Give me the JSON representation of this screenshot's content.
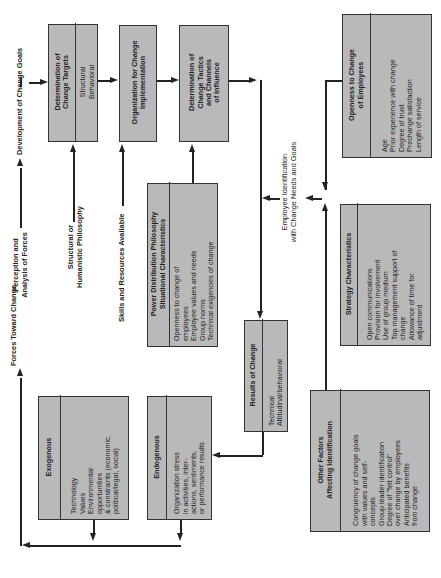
{
  "flow_labels": {
    "forces_toward_change": "Forces Toward Change",
    "perception_line1": "Perception and",
    "perception_line2": "Analysis of Forces",
    "development_goals": "Development of Change Goals",
    "philosophy_line1": "Structural or",
    "philosophy_line2": "Humanistic Philosophy",
    "skills_resources": "Skills and Resources Available",
    "identification_line1": "Employee Identification",
    "identification_line2": "with Change Needs and Goals"
  },
  "boxes": {
    "change_targets": {
      "title_line1": "Determination of",
      "title_line2": "Change Targets",
      "items": [
        "Structural",
        "Behavioral"
      ]
    },
    "organization": {
      "title_line1": "Organization for Change",
      "title_line2": "Implementation"
    },
    "tactics": {
      "title_line1": "Determination of",
      "title_line2": "Change Tactics",
      "title_line3": "and Channels",
      "title_line4": "of Influence"
    },
    "openness": {
      "title_line1": "Openness  to Change",
      "title_line2": "of Employees",
      "items": [
        "Age",
        "Prior experience with change",
        "Degree of trust",
        "Prechange satisfaction",
        "Length of service"
      ]
    },
    "power": {
      "title_line1": "Power Distribution Philosophy",
      "title_line2": "Situational Characteristics",
      "items": [
        "Openness to change of",
        "employees",
        "Employee values and needs",
        "Group norms",
        "Technical exigencies of change"
      ]
    },
    "strategy": {
      "title": "Strategy Characteristics",
      "items": [
        "Open communications",
        "Provision for involvement",
        "Use of group medium",
        "Top management support of",
        "change",
        "Allowance of time for",
        "adjustment"
      ]
    },
    "exogenous": {
      "title": "Exogenous",
      "items": [
        "Technology",
        "Values",
        "Environmental",
        "opportunities",
        "& constraints (economic,",
        "political/legal, social)"
      ]
    },
    "endogenous": {
      "title": "Endogenous",
      "items": [
        "Organization stress",
        "in activities, inter-",
        "actions, sentiments,",
        "or performance results"
      ]
    },
    "results": {
      "title": "Results of Change",
      "items": [
        "Technical",
        "Attitudinal/behavioral"
      ]
    },
    "other_factors": {
      "title_line1": "Other Factors",
      "title_line2": "Affecting Identification",
      "items": [
        "Congruency of change goals",
        "with values and self-",
        "concepts",
        "Group leader identification",
        "Degree of \"felt control\"",
        "over change by employees",
        "Anticipated benefits",
        "from change"
      ]
    }
  },
  "colors": {
    "box_fill": "#b9b9b9",
    "line": "#222222",
    "background": "#ffffff"
  }
}
